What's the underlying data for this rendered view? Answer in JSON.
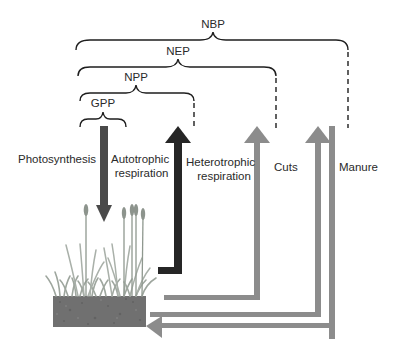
{
  "diagram": {
    "type": "carbon balance flux diagram",
    "braces": [
      {
        "label": "NBP"
      },
      {
        "label": "NEP"
      },
      {
        "label": "NPP"
      },
      {
        "label": "GPP"
      }
    ],
    "fluxes": [
      {
        "label": "Photosynthesis",
        "direction": "down"
      },
      {
        "label_line1": "Autotrophic",
        "label_line2": "respiration",
        "direction": "up"
      },
      {
        "label_line1": "Heterotrophic",
        "label_line2": "respiration",
        "direction": "up"
      },
      {
        "label": "Cuts",
        "direction": "up"
      },
      {
        "label": "Manure",
        "direction": "up-and-in"
      }
    ],
    "colors": {
      "photosynthesis_arrow": "#4a4a4a",
      "autotrophic_arrow": "#262626",
      "grey_arrows": "#8c8c8c",
      "brace": "#1e1e1e",
      "soil": "#6f6f6f",
      "plants": "#9aa39a"
    }
  }
}
